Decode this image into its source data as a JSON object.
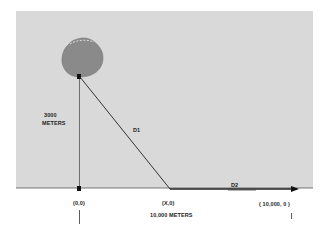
{
  "diagram": {
    "type": "geometry-distance-illustration",
    "colors": {
      "background": "#ffffff",
      "panel": "#d9d9d9",
      "cloud": "#8a8a8a",
      "line": "#333333"
    },
    "labels": {
      "height": "3000",
      "height_unit": "METERS",
      "d1": "D1",
      "d2": "D2",
      "origin": "(0,0)",
      "x_point": "(X,0)",
      "end_point": "( 10,000, 0 )",
      "distance": "10,000 METERS"
    },
    "points": [
      {
        "name": "origin",
        "label": "(0,0)",
        "x": 0,
        "y": 0
      },
      {
        "name": "x_point",
        "label": "(X,0)",
        "x": "X",
        "y": 0
      },
      {
        "name": "end_point",
        "label": "( 10,000, 0 )",
        "x": 10000,
        "y": 0
      },
      {
        "name": "cloud",
        "x": 0,
        "y": 3000
      }
    ],
    "segments": [
      {
        "name": "height",
        "from": "origin",
        "to": "cloud",
        "length_label": "3000 METERS"
      },
      {
        "name": "D1",
        "from": "cloud",
        "to": "x_point"
      },
      {
        "name": "D2",
        "from": "x_point",
        "to": "end_point"
      },
      {
        "name": "baseline",
        "from": "origin",
        "to": "end_point",
        "length_label": "10,000 METERS"
      }
    ]
  }
}
